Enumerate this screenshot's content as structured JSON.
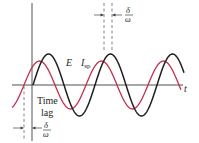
{
  "diagram": {
    "colors": {
      "axis": "#8a8a8a",
      "vertical_axis": "#555555",
      "e_curve": "#1e1e1e",
      "isp_curve": "#c0304a",
      "text": "#231f20",
      "dash": "#666666"
    },
    "axis": {
      "t_label": "t",
      "origin_x": 32,
      "baseline_y": 85,
      "x_start": 12,
      "x_end": 183,
      "y_top": 3,
      "y_bottom": 141
    },
    "curves": [
      {
        "name": "E",
        "label": "E",
        "color_key": "e_curve",
        "amplitude": 31,
        "period": 62,
        "zero_up_x": 33,
        "x_from": 33,
        "x_to": 184
      },
      {
        "name": "I_sp",
        "label_main": "I",
        "label_sub": "sp",
        "color_key": "isp_curve",
        "amplitude": 24,
        "period": 62,
        "zero_up_x": 24,
        "x_from": 12,
        "x_to": 181
      }
    ],
    "labels": {
      "e": "E",
      "isp_main": "I",
      "isp_sub": "sp",
      "time_lag_line1": "Time",
      "time_lag_line2": "lag",
      "delta": "δ",
      "omega": "ω"
    },
    "annotations": {
      "top_delta_over_omega": {
        "numerator": "δ",
        "denominator": "ω"
      },
      "bottom_delta_over_omega": {
        "numerator": "δ",
        "denominator": "ω"
      }
    }
  }
}
